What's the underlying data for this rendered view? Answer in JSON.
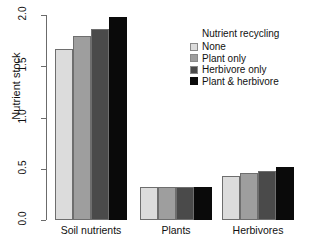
{
  "chart_data": {
    "type": "bar",
    "title": "",
    "xlabel": "",
    "ylabel": "Nutrient stock",
    "categories": [
      "Soil nutrients",
      "Plants",
      "Herbivores"
    ],
    "series": [
      {
        "name": "None",
        "color": "#dcdcdc",
        "values": [
          1.67,
          0.32,
          0.43
        ]
      },
      {
        "name": "Plant only",
        "color": "#9e9e9e",
        "values": [
          1.8,
          0.32,
          0.46
        ]
      },
      {
        "name": "Herbivore only",
        "color": "#4a4a4a",
        "values": [
          1.86,
          0.32,
          0.48
        ]
      },
      {
        "name": "Plant & herbivore",
        "color": "#0a0a0a",
        "values": [
          1.98,
          0.32,
          0.52
        ]
      }
    ],
    "ylim": [
      0.0,
      2.0
    ],
    "ytick_labels": [
      "0.0",
      "0.5",
      "1.0",
      "1.5",
      "2.0"
    ],
    "ytick_values": [
      0.0,
      0.5,
      1.0,
      1.5,
      2.0
    ],
    "grid": false,
    "legend_position": "top-right",
    "legend_title": "Nutrient recycling"
  },
  "axes": {
    "y_title": "Nutrient stock"
  },
  "legend": {
    "title": "Nutrient recycling",
    "entries": [
      {
        "label": "None",
        "color": "#dcdcdc"
      },
      {
        "label": "Plant only",
        "color": "#9e9e9e"
      },
      {
        "label": "Herbivore only",
        "color": "#4a4a4a"
      },
      {
        "label": "Plant & herbivore",
        "color": "#0a0a0a"
      }
    ]
  }
}
